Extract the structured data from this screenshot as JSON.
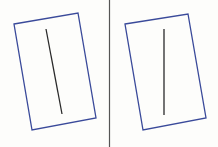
{
  "colors": {
    "background": "#fdfdfb",
    "rect_stroke": "#3a4a9a",
    "line_stroke": "#2a2a2a",
    "divider": "#555555"
  },
  "panels": [
    {
      "name": "left",
      "rect_points": "14,24 78,13 96,118 32,130",
      "line": {
        "x1": 46,
        "y1": 29,
        "x2": 62,
        "y2": 114
      }
    },
    {
      "name": "right",
      "rect_points": "125,24 188,14 206,118 143,130",
      "line": {
        "x1": 164,
        "y1": 29,
        "x2": 164,
        "y2": 115
      }
    }
  ],
  "divider": {
    "x": 109.5,
    "y1": 0,
    "y2": 147
  }
}
